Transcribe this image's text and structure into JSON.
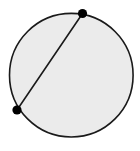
{
  "figure": {
    "type": "geometric-diagram",
    "canvas": {
      "width": 140,
      "height": 151,
      "background_color": "#ffffff"
    },
    "shapes": {
      "circle": {
        "label": "circle",
        "center_x": 71.3,
        "center_y": 75.2,
        "radius": 61.8,
        "fill_color": "#ebebeb",
        "stroke_color": "#1a1a1a",
        "stroke_width": 1.6
      },
      "chord": {
        "label": "chord",
        "x1": 82.5,
        "y1": 13.5,
        "x2": 17.0,
        "y2": 110.0,
        "stroke_color": "#1a1a1a",
        "stroke_width": 1.6
      },
      "points": [
        {
          "label": "upper-right endpoint",
          "cx": 82.5,
          "cy": 13.5,
          "r": 4.6,
          "fill_color": "#000000"
        },
        {
          "label": "lower-left endpoint",
          "cx": 17.0,
          "cy": 110.0,
          "r": 4.6,
          "fill_color": "#000000"
        }
      ]
    }
  }
}
